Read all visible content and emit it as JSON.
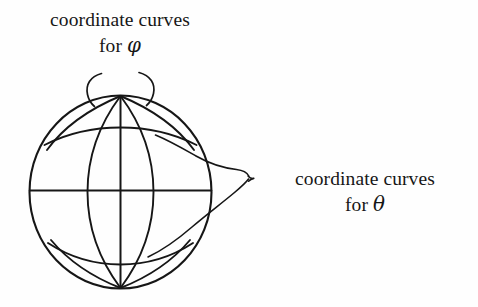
{
  "figure": {
    "type": "diagram",
    "ink_color": "#161616",
    "background_color": "#fefefe",
    "labels": {
      "phi": {
        "line1": "coordinate curves",
        "line2_prefix": "for ",
        "line2_symbol": "φ"
      },
      "theta": {
        "line1": "coordinate curves",
        "line2_prefix": "for ",
        "line2_symbol": "θ"
      }
    },
    "sphere": {
      "center_x": 121,
      "center_y": 192,
      "radius": 91,
      "north_pole_x": 120,
      "north_pole_y": 96,
      "south_pole_x": 120,
      "south_pole_y": 288,
      "meridian_count": 5,
      "latitude_count": 3
    },
    "pointers": {
      "phi_brace": "double-hook-brace-above-north-pole",
      "theta_brace": "curly-brace-right-pointing-tip"
    }
  }
}
